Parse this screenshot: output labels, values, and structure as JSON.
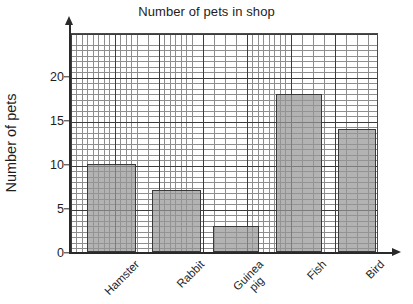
{
  "chart_data": {
    "type": "bar",
    "title": "Number of pets in shop",
    "xlabel": "",
    "ylabel": "Number of pets",
    "categories": [
      "Hamster",
      "Rabbit",
      "Guinea pig",
      "Fish",
      "Bird"
    ],
    "values": [
      10,
      7,
      3,
      18,
      14
    ],
    "ylim": [
      0,
      25
    ],
    "ytick_labels": [
      "0",
      "5",
      "10",
      "15",
      "20"
    ],
    "ytick_values": [
      0,
      5,
      10,
      15,
      20
    ],
    "grid": true,
    "grid_minor_step": 0.625,
    "grid_major_step": 5,
    "legend": "none",
    "orientation": "vertical",
    "bar_fill_color": "#969696",
    "bar_edge_color": "#3a3a3a",
    "grid_minor_color": "#8d8d8d",
    "grid_major_color": "#3c3c3c",
    "axis_color": "#2a2a2a",
    "background_color": "#ffffff",
    "text_color": "#1d1d1d"
  },
  "axis_labels": {
    "x_tick_lines": [
      {
        "line1": "Hamster",
        "line2": ""
      },
      {
        "line1": "Rabbit",
        "line2": ""
      },
      {
        "line1": "Guinea",
        "line2": "pig"
      },
      {
        "line1": "Fish",
        "line2": ""
      },
      {
        "line1": "Bird",
        "line2": ""
      }
    ]
  }
}
